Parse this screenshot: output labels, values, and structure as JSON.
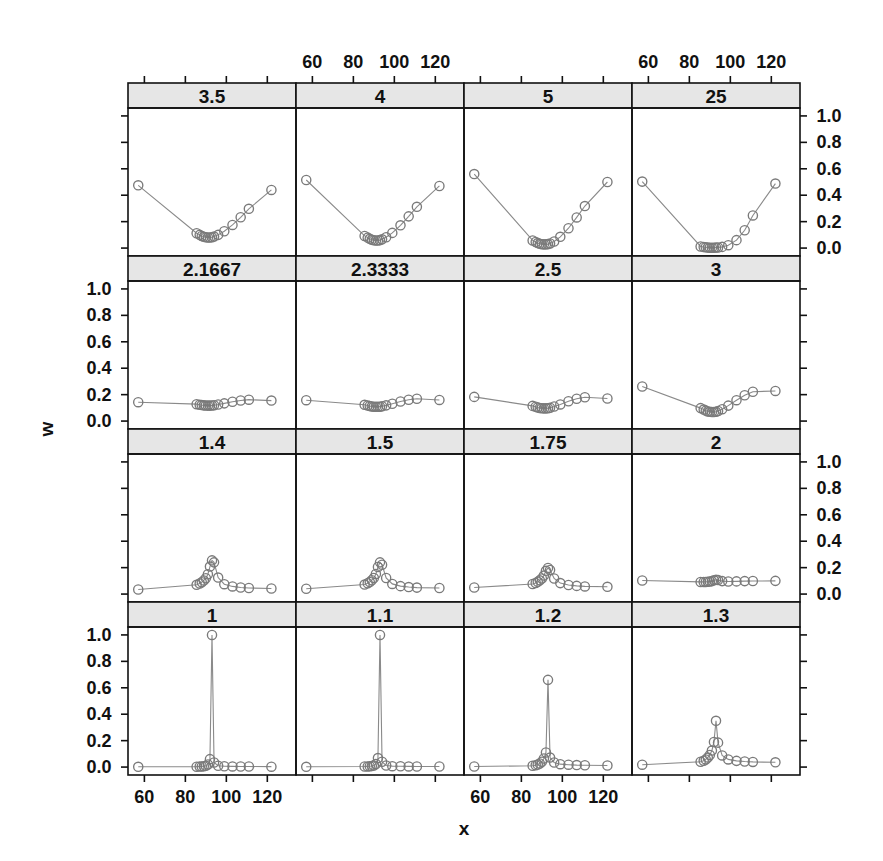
{
  "figure": {
    "type": "trellis-lattice-multipanel",
    "x_axis_title": "x",
    "y_axis_title": "w",
    "background": "#ffffff",
    "point_color": "#7a7a7a",
    "line_color": "#8a8a8a",
    "strip_fill": "#e6e6e6",
    "border_color": "#111111"
  },
  "chart_data": {
    "type": "scatter",
    "title": "",
    "xlabel": "x",
    "ylabel": "w",
    "xlim": [
      52,
      134
    ],
    "ylim": [
      -0.06,
      1.06
    ],
    "grid": false,
    "legend": null,
    "layout": {
      "rows": 4,
      "cols": 4,
      "strip_position": "top"
    },
    "x_ticks": [
      60,
      80,
      100,
      120
    ],
    "y_ticks": [
      0.0,
      0.2,
      0.4,
      0.6,
      0.8,
      1.0
    ],
    "x_tick_labels": [
      "60",
      "80",
      "100",
      "120"
    ],
    "y_tick_labels": [
      "0.0",
      "0.2",
      "0.4",
      "0.6",
      "0.8",
      "1.0"
    ],
    "axis_label_rows": {
      "left_labeled_rows": [
        1,
        3
      ],
      "right_labeled_rows": [
        0,
        2
      ],
      "top_labeled_cols": [
        1,
        3
      ],
      "bottom_labeled_cols": [
        0,
        2
      ]
    },
    "shared_x": [
      57.0,
      85.5,
      87.0,
      88.0,
      89.0,
      90.0,
      91.0,
      92.0,
      93.0,
      94.0,
      96.0,
      99.0,
      103.0,
      107.0,
      111.0,
      122.0
    ],
    "panels": [
      {
        "row": 0,
        "col": 0,
        "strip": "3.5",
        "values": [
          0.475,
          0.112,
          0.1,
          0.092,
          0.086,
          0.082,
          0.08,
          0.08,
          0.082,
          0.087,
          0.1,
          0.127,
          0.175,
          0.233,
          0.297,
          0.44
        ]
      },
      {
        "row": 0,
        "col": 1,
        "strip": "4",
        "values": [
          0.515,
          0.092,
          0.079,
          0.07,
          0.063,
          0.059,
          0.057,
          0.057,
          0.06,
          0.066,
          0.082,
          0.115,
          0.172,
          0.24,
          0.312,
          0.47
        ]
      },
      {
        "row": 0,
        "col": 2,
        "strip": "5",
        "values": [
          0.56,
          0.058,
          0.046,
          0.038,
          0.032,
          0.029,
          0.028,
          0.028,
          0.03,
          0.035,
          0.05,
          0.085,
          0.15,
          0.232,
          0.318,
          0.5
        ]
      },
      {
        "row": 0,
        "col": 3,
        "strip": "25",
        "values": [
          0.503,
          0.012,
          0.008,
          0.006,
          0.004,
          0.003,
          0.003,
          0.003,
          0.004,
          0.005,
          0.009,
          0.022,
          0.06,
          0.135,
          0.247,
          0.488
        ]
      },
      {
        "row": 1,
        "col": 0,
        "strip": "2.1667",
        "values": [
          0.143,
          0.128,
          0.124,
          0.121,
          0.119,
          0.118,
          0.117,
          0.117,
          0.118,
          0.12,
          0.125,
          0.134,
          0.146,
          0.156,
          0.162,
          0.155
        ]
      },
      {
        "row": 1,
        "col": 1,
        "strip": "2.3333",
        "values": [
          0.158,
          0.123,
          0.118,
          0.114,
          0.111,
          0.109,
          0.108,
          0.108,
          0.109,
          0.112,
          0.119,
          0.131,
          0.148,
          0.161,
          0.169,
          0.16
        ]
      },
      {
        "row": 1,
        "col": 2,
        "strip": "2.5",
        "values": [
          0.183,
          0.115,
          0.108,
          0.103,
          0.099,
          0.097,
          0.096,
          0.096,
          0.097,
          0.101,
          0.11,
          0.126,
          0.15,
          0.169,
          0.18,
          0.171
        ]
      },
      {
        "row": 1,
        "col": 3,
        "strip": "3",
        "values": [
          0.262,
          0.098,
          0.087,
          0.079,
          0.073,
          0.07,
          0.068,
          0.068,
          0.07,
          0.076,
          0.09,
          0.117,
          0.158,
          0.195,
          0.222,
          0.228
        ]
      },
      {
        "row": 2,
        "col": 0,
        "strip": "1.4",
        "values": [
          0.035,
          0.07,
          0.08,
          0.09,
          0.103,
          0.12,
          0.15,
          0.208,
          0.255,
          0.24,
          0.125,
          0.075,
          0.058,
          0.05,
          0.046,
          0.042
        ]
      },
      {
        "row": 2,
        "col": 1,
        "strip": "1.5",
        "values": [
          0.04,
          0.072,
          0.082,
          0.092,
          0.105,
          0.122,
          0.152,
          0.205,
          0.24,
          0.222,
          0.122,
          0.077,
          0.06,
          0.053,
          0.049,
          0.046
        ]
      },
      {
        "row": 2,
        "col": 2,
        "strip": "1.75",
        "values": [
          0.05,
          0.076,
          0.084,
          0.093,
          0.104,
          0.118,
          0.14,
          0.176,
          0.198,
          0.182,
          0.118,
          0.083,
          0.069,
          0.062,
          0.058,
          0.055
        ]
      },
      {
        "row": 2,
        "col": 3,
        "strip": "2",
        "values": [
          0.103,
          0.092,
          0.092,
          0.092,
          0.093,
          0.095,
          0.098,
          0.104,
          0.108,
          0.106,
          0.098,
          0.095,
          0.096,
          0.098,
          0.099,
          0.1
        ]
      },
      {
        "row": 3,
        "col": 0,
        "strip": "1",
        "values": [
          0.002,
          0.003,
          0.004,
          0.005,
          0.007,
          0.01,
          0.02,
          0.06,
          1.0,
          0.035,
          0.01,
          0.006,
          0.005,
          0.004,
          0.004,
          0.003
        ]
      },
      {
        "row": 3,
        "col": 1,
        "strip": "1.1",
        "values": [
          0.002,
          0.004,
          0.005,
          0.006,
          0.008,
          0.012,
          0.024,
          0.068,
          1.0,
          0.04,
          0.012,
          0.007,
          0.006,
          0.005,
          0.004,
          0.004
        ]
      },
      {
        "row": 3,
        "col": 2,
        "strip": "1.2",
        "values": [
          0.004,
          0.01,
          0.014,
          0.019,
          0.027,
          0.04,
          0.065,
          0.11,
          0.66,
          0.072,
          0.035,
          0.022,
          0.018,
          0.015,
          0.014,
          0.012
        ]
      },
      {
        "row": 3,
        "col": 3,
        "strip": "1.3",
        "values": [
          0.018,
          0.04,
          0.048,
          0.058,
          0.072,
          0.092,
          0.125,
          0.19,
          0.35,
          0.185,
          0.088,
          0.058,
          0.047,
          0.042,
          0.039,
          0.036
        ]
      }
    ]
  }
}
